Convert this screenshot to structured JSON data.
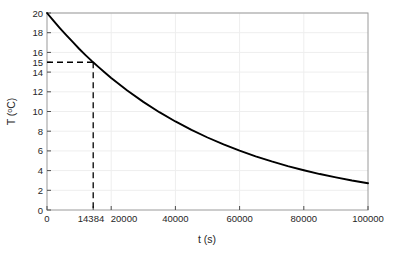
{
  "figure": {
    "background_color": "#ffffff",
    "frame_color": "#9a9a9a",
    "grid_color": "#eeeeee",
    "curve_color": "#000000",
    "annotation_color": "#000000"
  },
  "axis_titles": {
    "x": "t (s)",
    "y_prefix": "T (",
    "y_degree": "o",
    "y_suffix": "C)",
    "y_full": "T (oC)"
  },
  "x_ticks": [
    {
      "value": 0,
      "label": "0"
    },
    {
      "value": 20000,
      "label": "20000"
    },
    {
      "value": 40000,
      "label": "40000"
    },
    {
      "value": 60000,
      "label": "60000"
    },
    {
      "value": 80000,
      "label": "80000"
    },
    {
      "value": 100000,
      "label": "100000"
    }
  ],
  "x_special_tick": {
    "value": 14384,
    "label": "14384"
  },
  "y_ticks": [
    {
      "value": 0,
      "label": "0"
    },
    {
      "value": 2,
      "label": "2"
    },
    {
      "value": 4,
      "label": "4"
    },
    {
      "value": 6,
      "label": "6"
    },
    {
      "value": 8,
      "label": "8"
    },
    {
      "value": 10,
      "label": "10"
    },
    {
      "value": 12,
      "label": "12"
    },
    {
      "value": 14,
      "label": "14"
    },
    {
      "value": 16,
      "label": "16"
    },
    {
      "value": 18,
      "label": "18"
    },
    {
      "value": 20,
      "label": "20"
    }
  ],
  "y_special_tick": {
    "value": 15,
    "label": "15"
  },
  "annotation": {
    "t": 14384,
    "T": 15,
    "style": "dashed",
    "description": "dashed guide lines from T=15 on y-axis to the curve, then down to t=14384 on x-axis"
  },
  "chart_data": {
    "type": "line",
    "title": "",
    "xlabel": "t (s)",
    "ylabel": "T (oC)",
    "xlim": [
      0,
      100000
    ],
    "ylim": [
      0,
      20
    ],
    "grid": true,
    "legend": null,
    "model": "T = 20 * exp(-t / 50000)",
    "x": [
      0,
      2000,
      4000,
      6000,
      8000,
      10000,
      12000,
      14000,
      14384,
      16000,
      18000,
      20000,
      25000,
      30000,
      35000,
      40000,
      45000,
      50000,
      55000,
      60000,
      65000,
      70000,
      75000,
      80000,
      85000,
      90000,
      95000,
      100000
    ],
    "y": [
      20.0,
      19.22,
      18.47,
      17.75,
      17.06,
      16.37,
      15.73,
      15.11,
      15.0,
      14.53,
      13.96,
      13.41,
      12.13,
      10.98,
      9.93,
      8.99,
      8.13,
      7.36,
      6.66,
      6.02,
      5.45,
      4.93,
      4.46,
      4.04,
      3.65,
      3.31,
      2.99,
      2.71
    ],
    "annotations": [
      {
        "type": "dashed-crosshair",
        "x": 14384,
        "y": 15,
        "label_x": "14384",
        "label_y": "15"
      }
    ]
  }
}
